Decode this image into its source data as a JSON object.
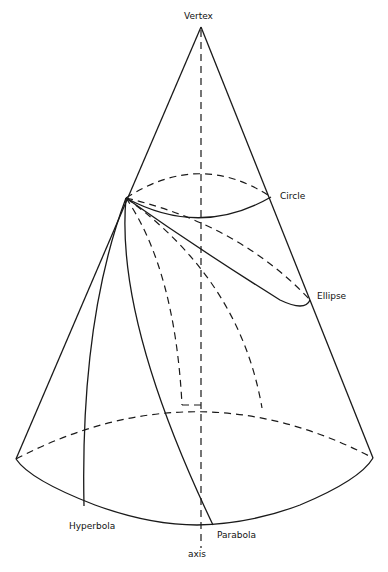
{
  "figure": {
    "type": "conic-sections-diagram",
    "labels": {
      "vertex": "Vertex",
      "circle": "Circle",
      "ellipse": "Ellipse",
      "hyperbola": "Hyperbola",
      "parabola": "Parabola",
      "axis": "axis"
    },
    "colors": {
      "line": "#1a1a1a",
      "background": "#ffffff"
    }
  }
}
